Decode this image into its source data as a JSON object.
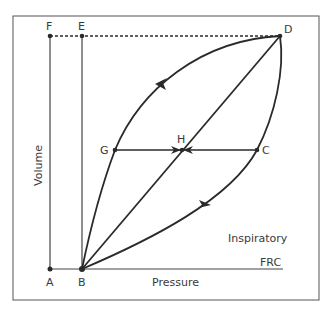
{
  "diagram": {
    "axes": {
      "x_label": "Pressure",
      "y_label": "Volume"
    },
    "annotations": {
      "inspiratory": "Inspiratory",
      "frc": "FRC"
    },
    "points": {
      "A": "A",
      "B": "B",
      "C": "C",
      "D": "D",
      "E": "E",
      "F": "F",
      "G": "G",
      "H": "H"
    },
    "colors": {
      "line": "#2a2a2a",
      "frame": "#555555",
      "text": "#3a3a3a"
    }
  }
}
